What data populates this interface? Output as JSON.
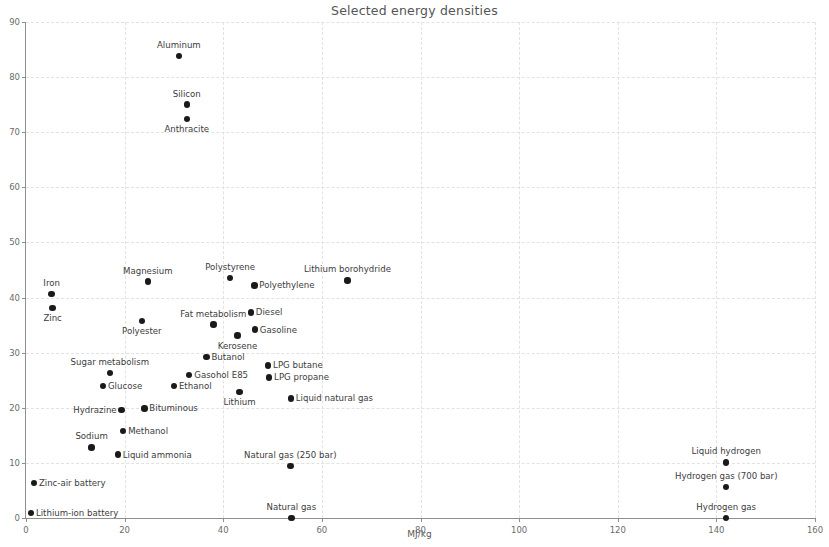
{
  "chart_data": {
    "type": "scatter",
    "title": "Selected energy densities",
    "xlabel": "MJ/kg",
    "ylabel": "MJ/L",
    "xlim": [
      0,
      160
    ],
    "ylim": [
      0,
      90
    ],
    "xticks": [
      0,
      20,
      40,
      60,
      80,
      100,
      120,
      140,
      160
    ],
    "yticks": [
      0,
      10,
      20,
      30,
      40,
      50,
      60,
      70,
      80,
      90
    ],
    "grid": true,
    "legend": "none",
    "points": [
      {
        "label": "Aluminum",
        "x": 31.0,
        "y": 83.8,
        "label_pos": "above"
      },
      {
        "label": "Silicon",
        "x": 32.6,
        "y": 75.0,
        "label_pos": "above"
      },
      {
        "label": "Anthracite",
        "x": 32.6,
        "y": 72.4,
        "label_pos": "below"
      },
      {
        "label": "Magnesium",
        "x": 24.7,
        "y": 42.9,
        "label_pos": "above"
      },
      {
        "label": "Polystyrene",
        "x": 41.4,
        "y": 43.5,
        "label_pos": "above"
      },
      {
        "label": "Polyethylene",
        "x": 46.3,
        "y": 42.2,
        "label_pos": "right"
      },
      {
        "label": "Lithium borohydride",
        "x": 65.2,
        "y": 43.1,
        "label_pos": "above"
      },
      {
        "label": "Iron",
        "x": 5.2,
        "y": 40.6,
        "label_pos": "above"
      },
      {
        "label": "Zinc",
        "x": 5.4,
        "y": 38.1,
        "label_pos": "below"
      },
      {
        "label": "Diesel",
        "x": 45.6,
        "y": 37.3,
        "label_pos": "right"
      },
      {
        "label": "Fat metabolism",
        "x": 38.0,
        "y": 35.1,
        "label_pos": "above"
      },
      {
        "label": "Gasoline",
        "x": 46.4,
        "y": 34.2,
        "label_pos": "right"
      },
      {
        "label": "Polyester",
        "x": 23.5,
        "y": 35.7,
        "label_pos": "below"
      },
      {
        "label": "Kerosene",
        "x": 42.9,
        "y": 33.1,
        "label_pos": "below"
      },
      {
        "label": "Butanol",
        "x": 36.6,
        "y": 29.2,
        "label_pos": "right"
      },
      {
        "label": "Sugar metabolism",
        "x": 17.0,
        "y": 26.3,
        "label_pos": "above"
      },
      {
        "label": "Gasohol E85",
        "x": 33.1,
        "y": 25.9,
        "label_pos": "right"
      },
      {
        "label": "LPG butane",
        "x": 49.1,
        "y": 27.7,
        "label_pos": "right"
      },
      {
        "label": "Glucose",
        "x": 15.6,
        "y": 23.9,
        "label_pos": "right"
      },
      {
        "label": "Ethanol",
        "x": 30.0,
        "y": 24.0,
        "label_pos": "right"
      },
      {
        "label": "LPG propane",
        "x": 49.3,
        "y": 25.5,
        "label_pos": "right"
      },
      {
        "label": "Lithium",
        "x": 43.3,
        "y": 22.9,
        "label_pos": "below"
      },
      {
        "label": "Liquid natural gas",
        "x": 53.7,
        "y": 21.7,
        "label_pos": "right"
      },
      {
        "label": "Hydrazine",
        "x": 19.4,
        "y": 19.6,
        "label_pos": "left"
      },
      {
        "label": "Bituminous",
        "x": 24.0,
        "y": 19.9,
        "label_pos": "right"
      },
      {
        "label": "Methanol",
        "x": 19.7,
        "y": 15.8,
        "label_pos": "right"
      },
      {
        "label": "Sodium",
        "x": 13.3,
        "y": 12.8,
        "label_pos": "above"
      },
      {
        "label": "Liquid ammonia",
        "x": 18.6,
        "y": 11.5,
        "label_pos": "right"
      },
      {
        "label": "Natural gas (250 bar)",
        "x": 53.6,
        "y": 9.4,
        "label_pos": "above"
      },
      {
        "label": "Liquid hydrogen",
        "x": 142.0,
        "y": 10.1,
        "label_pos": "above"
      },
      {
        "label": "Hydrogen gas (700 bar)",
        "x": 142.0,
        "y": 5.6,
        "label_pos": "above"
      },
      {
        "label": "Zinc-air battery",
        "x": 1.6,
        "y": 6.3,
        "label_pos": "right"
      },
      {
        "label": "Lithium-ion battery",
        "x": 1.0,
        "y": 0.9,
        "label_pos": "right"
      },
      {
        "label": "Natural gas",
        "x": 53.8,
        "y": 0.04,
        "label_pos": "above"
      },
      {
        "label": "Hydrogen gas",
        "x": 142.0,
        "y": 0.01,
        "label_pos": "above"
      }
    ]
  },
  "style": {
    "axis_color": "#8f8f8f",
    "grid_color": "#e2e2e2",
    "marker_color": "#1a1a1a",
    "text_color": "#3c3c3c",
    "background": "#ffffff"
  }
}
